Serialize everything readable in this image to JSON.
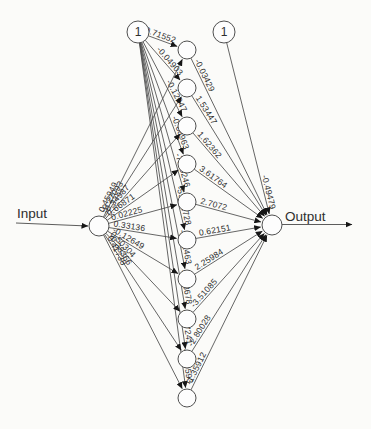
{
  "diagram": {
    "type": "neural-network",
    "io": {
      "input_label": "Input",
      "output_label": "Output",
      "bias_label": "1"
    },
    "nodes": {
      "input": {
        "x": 99,
        "y": 226,
        "r": 10
      },
      "output": {
        "x": 272,
        "y": 225,
        "r": 10
      },
      "bias_hidden": {
        "x": 138,
        "y": 32,
        "r": 11
      },
      "bias_output": {
        "x": 224,
        "y": 32,
        "r": 11
      },
      "hidden_x": 187,
      "hidden_r": 9,
      "hidden_y": [
        50,
        88,
        126,
        164,
        202,
        240,
        279,
        319,
        359,
        398
      ]
    },
    "weights": {
      "bias_to_hidden": [
        "0.71552",
        "-0.04903",
        "-0.12047",
        "-0.08963",
        "-7.60246",
        "-55.91728",
        "-2.21463",
        "-0.48678",
        "-0.17241",
        "-0.50593"
      ],
      "input_to_hidden": [
        "0.45949",
        "-0.27093",
        "-0.34987",
        "0.66871",
        "0.02225",
        "0.33136",
        "-0.12649",
        "0.50304",
        "-0.38366",
        "0.41738"
      ],
      "hidden_to_output": [
        "-0.03429",
        "1.53447",
        "1.62362",
        "3.61764",
        "2.7072",
        "0.62151",
        "2.25984",
        "-3.51085",
        "-2.80028",
        "-1.35912"
      ],
      "bias_to_output": "-0.49479"
    },
    "arrows": {
      "input_line": {
        "x1": 16,
        "y1": 223,
        "x2": 88,
        "y2": 226
      },
      "output_line": {
        "x1": 282,
        "y1": 224.5,
        "x2": 352,
        "y2": 224.5
      }
    },
    "colors": {
      "background": "#fbfbf9",
      "line": "#4a4a4a",
      "node_fill": "#fdfdfd",
      "node_stroke": "#4f4f4f",
      "text": "#2e2e2e",
      "arrowhead": "#161616"
    }
  }
}
